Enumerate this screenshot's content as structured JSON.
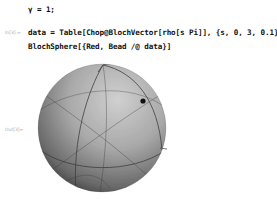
{
  "notebook": {
    "cells": [
      {
        "type": "input",
        "label": "",
        "code": "γ = 1;"
      },
      {
        "type": "input",
        "label": "In[3]:=",
        "lines": [
          "data = Table[Chop@BlochVector[rho[s Pi]], {s, 0, 3, 0.1}];",
          "BlochSphere[{Red, Bead /@ data}]"
        ]
      },
      {
        "type": "output",
        "label": "Out[3]=",
        "content": "bloch-sphere-3d-graphic"
      }
    ]
  },
  "graphic": {
    "sphere": {
      "cx": 102,
      "cy": 128,
      "r": 64,
      "shade_light": "#c8c8c8",
      "shade_dark": "#3a3a3a"
    },
    "bead": {
      "x": 143,
      "y": 101,
      "r": 2.6,
      "color": "#111111"
    }
  }
}
